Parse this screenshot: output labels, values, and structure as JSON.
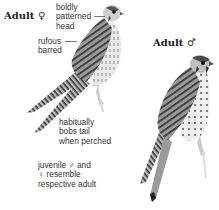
{
  "plate": {
    "subject": "American Kestrel",
    "female": {
      "title": "Adult ♀",
      "annotations": [
        {
          "id": "head",
          "text": "boldly\npatterned\nhead"
        },
        {
          "id": "back",
          "text": "rufous\nbarred"
        },
        {
          "id": "tail",
          "text": "habitually\nbobs tail\nwhen perched"
        }
      ]
    },
    "male": {
      "title": "Adult ♂"
    },
    "note": "juvenile ♂ and\n♀ resemble\nrespective adult"
  },
  "colors": {
    "background": "#ffffff",
    "plumage_dark": "#3a3a3a",
    "plumage_mid": "#8a8a8a",
    "plumage_light": "#d8d8d8",
    "leader_line": "#777777"
  }
}
